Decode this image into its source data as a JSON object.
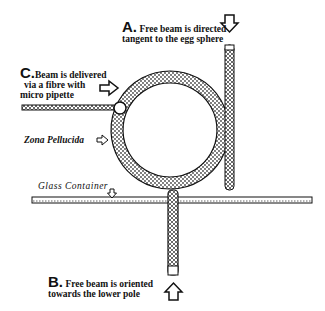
{
  "diagram": {
    "labels": {
      "a": {
        "letter": "A.",
        "line1": "Free beam is directed",
        "line2": "tangent to the egg sphere"
      },
      "b": {
        "letter": "B.",
        "line1": "Free beam is oriented",
        "line2": "towards the lower pole"
      },
      "c": {
        "letter": "C.",
        "line1": "Beam is delivered",
        "line2": "via a fibre with",
        "line3": "micro pipette"
      },
      "zona": "Zona Pellucida",
      "glass": "Glass Container"
    },
    "colors": {
      "stroke": "#111111",
      "fill": "#ffffff",
      "stipple": "#555555"
    }
  }
}
